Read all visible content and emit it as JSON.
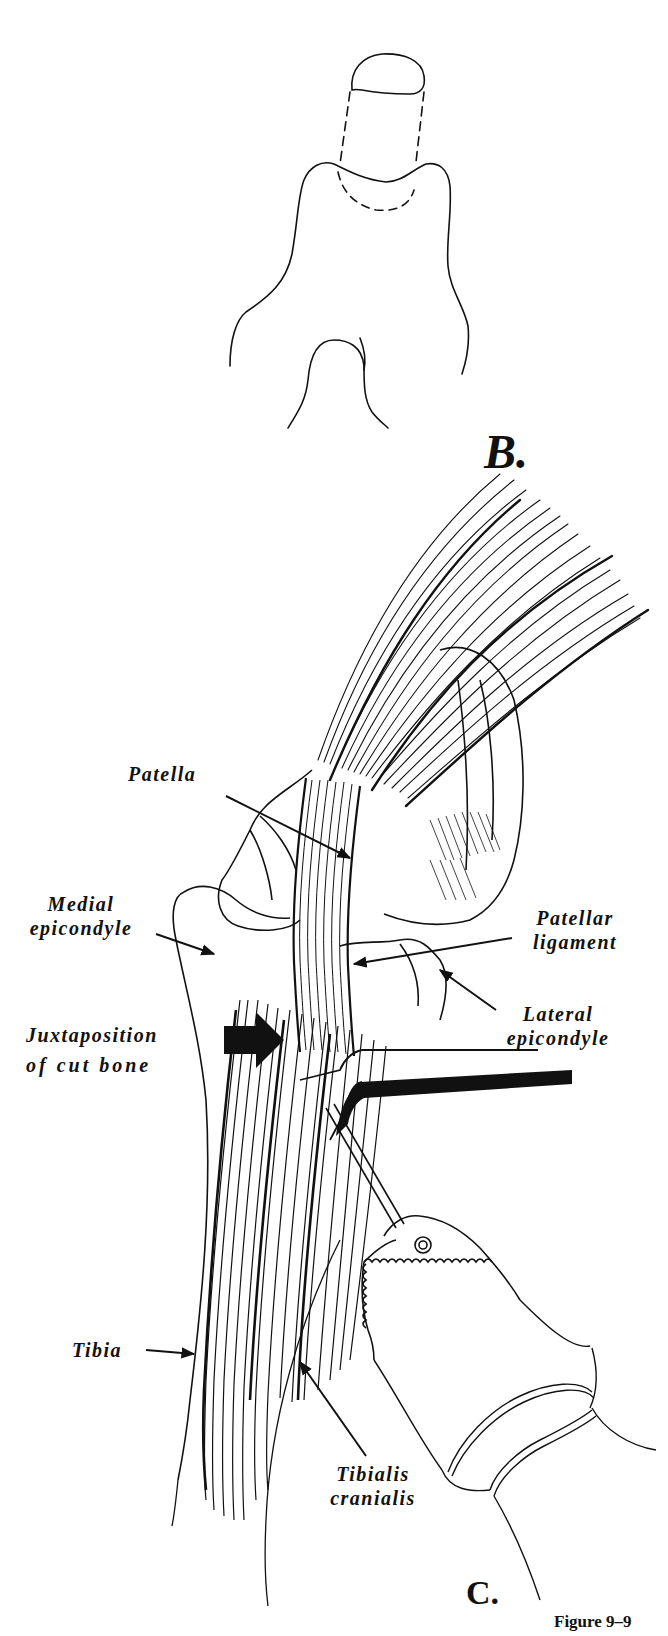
{
  "figure": {
    "caption": "Figure 9–9",
    "panels": [
      {
        "id": "B",
        "letter": "B."
      },
      {
        "id": "C",
        "letter": "C."
      }
    ]
  },
  "labels": {
    "patella": "Patella",
    "medial_epicondyle": [
      "Medial",
      "epicondyle"
    ],
    "patellar_ligament": [
      "Patellar",
      "ligament"
    ],
    "lateral_epicondyle": [
      "Lateral",
      "epicondyle"
    ],
    "juxtaposition": [
      "Juxtaposition",
      "of cut bone"
    ],
    "tibia": "Tibia",
    "tibialis_cranialis": [
      "Tibialis",
      "cranialis"
    ]
  },
  "colors": {
    "ink": "#111111",
    "paper": "#ffffff"
  }
}
